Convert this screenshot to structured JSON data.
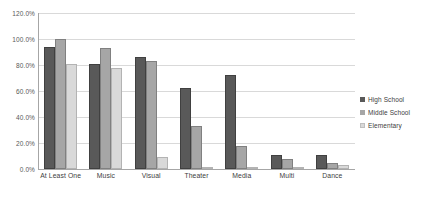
{
  "chart_data": {
    "type": "bar",
    "title": "",
    "subtitle": "",
    "xlabel": "",
    "ylabel": "",
    "categories": [
      "At Least One",
      "Music",
      "Visual",
      "Theater",
      "Media",
      "Multi",
      "Dance"
    ],
    "series": [
      {
        "name": "High School",
        "color": "#595959",
        "values": [
          94,
          81,
          86,
          62,
          72,
          11,
          11
        ]
      },
      {
        "name": "Middle School",
        "color": "#a6a6a6",
        "values": [
          100,
          93,
          83,
          33,
          18,
          8,
          5
        ]
      },
      {
        "name": "Elementary",
        "color": "#d9d9d9",
        "values": [
          81,
          78,
          9,
          1,
          1,
          1,
          3
        ]
      }
    ],
    "ylim": [
      0,
      120
    ],
    "ytick_values": [
      0,
      20,
      40,
      60,
      80,
      100,
      120
    ],
    "ytick_labels": [
      "0.0%",
      "20.0%",
      "40.0%",
      "60.0%",
      "80.0%",
      "100.0%",
      "120.0%"
    ],
    "grid": true,
    "grid_axis": "y",
    "legend_position": "right",
    "value_unit": "percent",
    "background_color": "#ffffff",
    "gridline_color": "#d9d9d9",
    "axis_color": "#a6a6a6"
  }
}
